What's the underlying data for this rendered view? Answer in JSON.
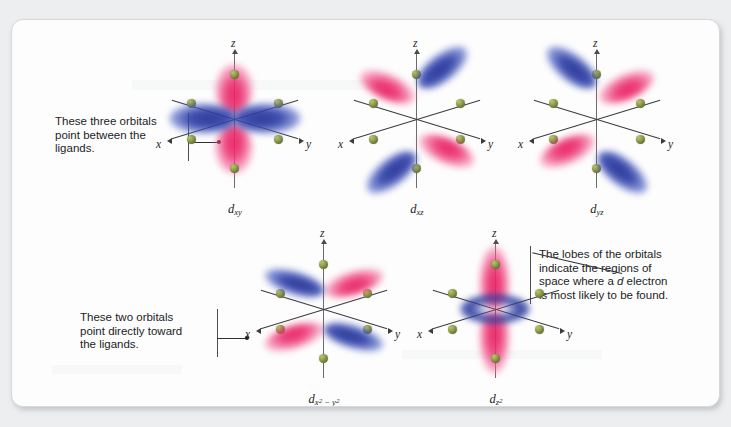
{
  "figure": {
    "background_color": "#eceef0",
    "card_color": "#fdfdfd",
    "ligand_color": "#93a049",
    "lobe_color_blue": "#2a3696",
    "lobe_color_pink": "#e71e60"
  },
  "annotations": {
    "top_left": {
      "text": "These three orbitals\npoint between the\nligands.",
      "target": "d-xy orbital"
    },
    "bottom_left": {
      "text": "These two orbitals\npoint directly toward\nthe ligands.",
      "target": "d-x2-y2 orbital"
    },
    "right": {
      "text_before_italic": "The lobes of the orbitals\nindicate the regions of\nspace where a ",
      "italic_word": "d",
      "text_after_italic": " electron\nis most likely to be found.",
      "full_text": "The lobes of the orbitals indicate the regions of space where a d electron is most likely to be found.",
      "target": "d-z2 orbital"
    }
  },
  "orbitals": [
    {
      "id": "dxy",
      "name": "d",
      "subscript": "xy",
      "row": "top",
      "axis_labels": {
        "z": "z",
        "x": "x",
        "y": "y"
      },
      "ligand_count": 6,
      "lobe_orientation": "between axes",
      "lobes": [
        {
          "color": "blue",
          "direction": "left"
        },
        {
          "color": "blue",
          "direction": "right"
        },
        {
          "color": "pink",
          "direction": "up"
        },
        {
          "color": "pink",
          "direction": "down"
        }
      ]
    },
    {
      "id": "dxz",
      "name": "d",
      "subscript": "xz",
      "row": "top",
      "axis_labels": {
        "z": "z",
        "x": "x",
        "y": "y"
      },
      "ligand_count": 6,
      "lobe_orientation": "between axes",
      "lobes": [
        {
          "color": "blue",
          "direction": "upper-right"
        },
        {
          "color": "blue",
          "direction": "lower-left"
        },
        {
          "color": "pink",
          "direction": "upper-left"
        },
        {
          "color": "pink",
          "direction": "lower-right"
        }
      ]
    },
    {
      "id": "dyz",
      "name": "d",
      "subscript": "yz",
      "row": "top",
      "axis_labels": {
        "z": "z",
        "x": "x",
        "y": "y"
      },
      "ligand_count": 6,
      "lobe_orientation": "between axes",
      "lobes": [
        {
          "color": "blue",
          "direction": "upper-left"
        },
        {
          "color": "blue",
          "direction": "lower-right"
        },
        {
          "color": "pink",
          "direction": "upper-right"
        },
        {
          "color": "pink",
          "direction": "lower-left"
        }
      ]
    },
    {
      "id": "dx2y2",
      "name": "d",
      "subscript_base": "x",
      "subscript_exp1": "2",
      "subscript_mid": " − y",
      "subscript_exp2": "2",
      "row": "bottom",
      "axis_labels": {
        "z": "z",
        "x": "x",
        "y": "y"
      },
      "ligand_count": 6,
      "lobe_orientation": "along axes",
      "lobes": [
        {
          "color": "pink",
          "direction": "along +y"
        },
        {
          "color": "pink",
          "direction": "along -y"
        },
        {
          "color": "blue",
          "direction": "along +x"
        },
        {
          "color": "blue",
          "direction": "along -x"
        }
      ]
    },
    {
      "id": "dz2",
      "name": "d",
      "subscript_base": "z",
      "subscript_exp1": "2",
      "row": "bottom",
      "axis_labels": {
        "z": "z",
        "x": "x",
        "y": "y"
      },
      "ligand_count": 6,
      "lobe_orientation": "along z axis with xy torus",
      "lobes": [
        {
          "color": "pink",
          "direction": "along +z"
        },
        {
          "color": "pink",
          "direction": "along -z"
        },
        {
          "color": "blue",
          "direction": "torus in xy plane"
        }
      ]
    }
  ]
}
